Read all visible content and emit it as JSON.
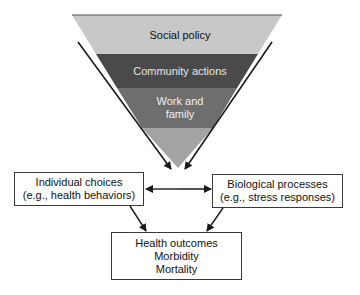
{
  "pyramid": {
    "layers": [
      {
        "label": "Social policy",
        "color": "#c8c8c8",
        "text_color": "#111111"
      },
      {
        "label": "Community actions",
        "color": "#4a4a4a",
        "text_color": "#e6e6e6"
      },
      {
        "label_line1": "Work and",
        "label_line2": "family",
        "color": "#6e6e6e",
        "text_color": "#eeeeee"
      },
      {
        "label": "",
        "color": "#a4a4a4"
      }
    ]
  },
  "boxes": {
    "individual": {
      "line1": "Individual choices",
      "line2": "(e.g., health behaviors)"
    },
    "biological": {
      "line1": "Biological processes",
      "line2": "(e.g., stress responses)"
    },
    "outcomes": {
      "line1": "Health outcomes",
      "line2": "Morbidity",
      "line3": "Mortality"
    }
  },
  "colors": {
    "line": "#1a1a1a",
    "border": "#3a3a3a"
  }
}
